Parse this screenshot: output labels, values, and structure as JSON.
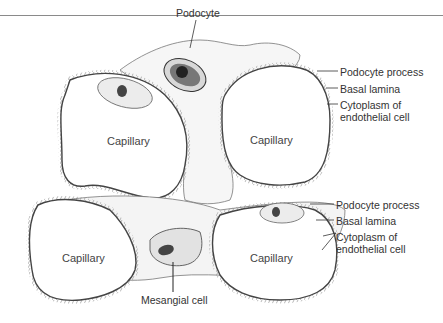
{
  "figure": {
    "labels": {
      "podocyte": "Podocyte",
      "capillary_top_left": "Capillary",
      "capillary_top_right": "Capillary",
      "capillary_bottom_left": "Capillary",
      "capillary_bottom_right": "Capillary",
      "mesangial_cell": "Mesangial cell",
      "upper_callouts": {
        "podocyte_process": "Podocyte process",
        "basal_lamina": "Basal lamina",
        "cytoplasm_line1": "Cytoplasm of",
        "cytoplasm_line2": "endothelial cell"
      },
      "lower_callouts": {
        "podocyte_process": "Podocyte process",
        "basal_lamina": "Basal lamina",
        "cytoplasm_line1": "Cytoplasm of",
        "cytoplasm_line2": "endothelial cell"
      }
    },
    "colors": {
      "line": "#555555",
      "cell_fill": "#f2f2f2",
      "nucleus": "#333333"
    }
  }
}
